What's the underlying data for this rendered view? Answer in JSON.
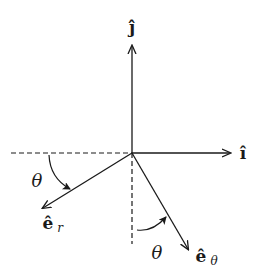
{
  "diagram": {
    "type": "polar-unit-vectors",
    "origin": {
      "x": 132,
      "y": 153
    },
    "colors": {
      "ink": "#1a1a1a",
      "background": "#ffffff"
    },
    "labels": {
      "j_hat": "ĵ",
      "i_hat": "î",
      "e_r_base": "ê",
      "e_r_sub": "r",
      "e_theta_base": "ê",
      "e_theta_sub": "θ",
      "theta_left": "θ",
      "theta_bottom": "θ"
    },
    "vectors": [
      {
        "name": "j-hat",
        "label": "ĵ",
        "direction": "up"
      },
      {
        "name": "i-hat",
        "label": "î",
        "direction": "right"
      },
      {
        "name": "e-r",
        "label": "ê_r",
        "direction": "down-left"
      },
      {
        "name": "e-theta",
        "label": "ê_θ",
        "direction": "down-right"
      }
    ],
    "reference_lines": [
      {
        "name": "negative-x-axis",
        "style": "dashed"
      },
      {
        "name": "negative-y-axis",
        "style": "dashed"
      }
    ],
    "angles": [
      {
        "label": "θ",
        "between": [
          "negative-x-axis",
          "e-r"
        ]
      },
      {
        "label": "θ",
        "between": [
          "negative-y-axis",
          "e-theta"
        ]
      }
    ]
  }
}
